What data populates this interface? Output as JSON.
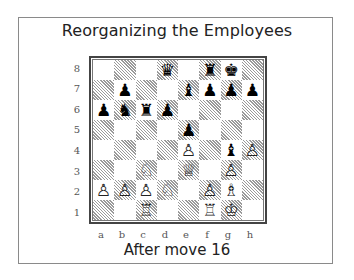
{
  "title": "Reorganizing the Employees",
  "caption": "After move 16",
  "colors": {
    "frame": "#8a8a8a",
    "board_border": "#444444",
    "dark_square_hatch": "#9a9a9a",
    "light_square": "#ffffff"
  },
  "board": {
    "files": [
      "a",
      "b",
      "c",
      "d",
      "e",
      "f",
      "g",
      "h"
    ],
    "ranks": [
      "8",
      "7",
      "6",
      "5",
      "4",
      "3",
      "2",
      "1"
    ],
    "rows": [
      [
        "",
        "",
        "",
        "♛",
        "",
        "♜",
        "♚",
        ""
      ],
      [
        "",
        "♟",
        "",
        "",
        "♝",
        "♟",
        "♟",
        "♟"
      ],
      [
        "♟",
        "♞",
        "♜",
        "♟",
        "",
        "",
        "",
        ""
      ],
      [
        "",
        "",
        "",
        "",
        "♟",
        "",
        "",
        ""
      ],
      [
        "",
        "",
        "",
        "",
        "♙",
        "",
        "♝",
        "♙"
      ],
      [
        "",
        "",
        "♘",
        "",
        "♕",
        "",
        "♙",
        ""
      ],
      [
        "♙",
        "♙",
        "♙",
        "♘",
        "",
        "♙",
        "♗",
        ""
      ],
      [
        "",
        "",
        "♖",
        "",
        "",
        "♖",
        "♔",
        ""
      ]
    ],
    "pieces": [
      {
        "square": "d8",
        "piece": "black-queen"
      },
      {
        "square": "f8",
        "piece": "black-rook"
      },
      {
        "square": "g8",
        "piece": "black-king"
      },
      {
        "square": "b7",
        "piece": "black-pawn"
      },
      {
        "square": "e7",
        "piece": "black-bishop"
      },
      {
        "square": "f7",
        "piece": "black-pawn"
      },
      {
        "square": "g7",
        "piece": "black-pawn"
      },
      {
        "square": "h7",
        "piece": "black-pawn"
      },
      {
        "square": "a6",
        "piece": "black-pawn"
      },
      {
        "square": "b6",
        "piece": "black-knight"
      },
      {
        "square": "c6",
        "piece": "black-rook"
      },
      {
        "square": "d6",
        "piece": "black-pawn"
      },
      {
        "square": "e5",
        "piece": "black-pawn"
      },
      {
        "square": "e4",
        "piece": "white-pawn"
      },
      {
        "square": "g4",
        "piece": "black-bishop"
      },
      {
        "square": "h4",
        "piece": "white-pawn"
      },
      {
        "square": "c3",
        "piece": "white-knight"
      },
      {
        "square": "e3",
        "piece": "white-queen"
      },
      {
        "square": "g3",
        "piece": "white-pawn"
      },
      {
        "square": "a2",
        "piece": "white-pawn"
      },
      {
        "square": "b2",
        "piece": "white-pawn"
      },
      {
        "square": "c2",
        "piece": "white-pawn"
      },
      {
        "square": "d2",
        "piece": "white-knight"
      },
      {
        "square": "f2",
        "piece": "white-pawn"
      },
      {
        "square": "g2",
        "piece": "white-bishop"
      },
      {
        "square": "c1",
        "piece": "white-rook"
      },
      {
        "square": "f1",
        "piece": "white-rook"
      },
      {
        "square": "g1",
        "piece": "white-king"
      }
    ]
  }
}
